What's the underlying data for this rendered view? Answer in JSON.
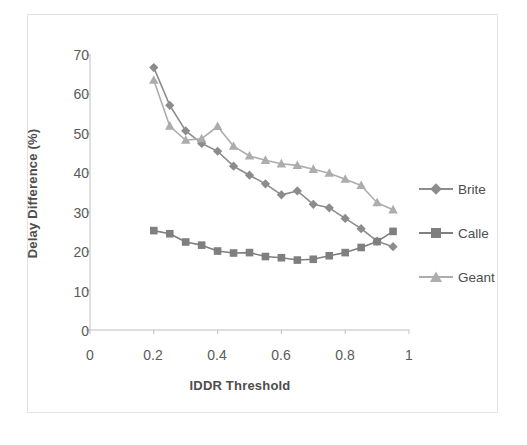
{
  "chart_data": {
    "type": "line",
    "title": "",
    "xlabel": "IDDR Threshold",
    "ylabel": "Delay Difference (%)",
    "xlim": [
      0,
      1
    ],
    "ylim": [
      0,
      70
    ],
    "xticks": [
      "0",
      "0.2",
      "0.4",
      "0.6",
      "0.8",
      "1"
    ],
    "xtick_values": [
      0,
      0.2,
      0.4,
      0.6,
      0.8,
      1
    ],
    "yticks": [
      "0",
      "10",
      "20",
      "30",
      "40",
      "50",
      "60",
      "70"
    ],
    "ytick_values": [
      0,
      10,
      20,
      30,
      40,
      50,
      60,
      70
    ],
    "grid": false,
    "legend_position": "right",
    "x": [
      0.2,
      0.25,
      0.3,
      0.35,
      0.4,
      0.45,
      0.5,
      0.55,
      0.6,
      0.65,
      0.7,
      0.75,
      0.8,
      0.85,
      0.9,
      0.95
    ],
    "series": [
      {
        "name": "Brite",
        "marker": "diamond",
        "color": "#8c8c8c",
        "values": [
          66.8,
          57.2,
          50.7,
          47.5,
          45.5,
          41.7,
          39.4,
          37.2,
          34.4,
          35.4,
          32.0,
          31.1,
          28.4,
          25.8,
          22.6,
          21.2
        ]
      },
      {
        "name": "Calle",
        "marker": "square",
        "color": "#7f7f7f",
        "values": [
          25.3,
          24.5,
          22.4,
          21.6,
          20.1,
          19.6,
          19.7,
          18.7,
          18.4,
          17.8,
          18.0,
          18.9,
          19.7,
          21.0,
          22.5,
          25.1
        ]
      },
      {
        "name": "Geant",
        "marker": "triangle",
        "color": "#adadad",
        "values": [
          63.6,
          51.9,
          48.3,
          48.7,
          51.8,
          46.8,
          44.3,
          43.2,
          42.3,
          41.9,
          40.9,
          39.9,
          38.4,
          36.8,
          32.4,
          30.6
        ]
      }
    ]
  },
  "legend": {
    "items": [
      {
        "label": "Brite"
      },
      {
        "label": "Calle"
      },
      {
        "label": "Geant"
      }
    ]
  },
  "colors": {
    "axis": "#bfbfbf",
    "tick_text": "#5a5a5a",
    "title_text": "#4d4d4d",
    "frame": "#e3e3e3",
    "background": "#ffffff"
  }
}
